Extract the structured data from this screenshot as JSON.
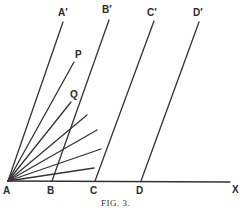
{
  "figure": {
    "caption": "Fig. 3.",
    "caption_display": "FIG. 3.",
    "stroke_color": "#333333",
    "background": "#ffffff"
  },
  "points": {
    "A": {
      "label": "A",
      "x": 8,
      "y": 181
    },
    "B": {
      "label": "B",
      "x": 52,
      "y": 181
    },
    "C": {
      "label": "C",
      "x": 95,
      "y": 181
    },
    "D": {
      "label": "D",
      "x": 141,
      "y": 181
    },
    "X": {
      "label": "X",
      "x": 230,
      "y": 182
    }
  },
  "upper_points": {
    "A_prime": {
      "label": "A′",
      "x": 63,
      "y": 22
    },
    "B_prime": {
      "label": "B′",
      "x": 109,
      "y": 20
    },
    "C_prime": {
      "label": "C′",
      "x": 154,
      "y": 21
    },
    "D_prime": {
      "label": "D′",
      "x": 199,
      "y": 22
    },
    "P": {
      "label": "P",
      "x": 74,
      "y": 62
    },
    "Q": {
      "label": "Q",
      "x": 71,
      "y": 102
    }
  },
  "labels": {
    "A": "A",
    "B": "B",
    "C": "C",
    "D": "D",
    "X": "X",
    "A_prime": "A′",
    "B_prime": "B′",
    "C_prime": "C′",
    "D_prime": "D′",
    "P": "P",
    "Q": "Q"
  },
  "fan_rays_from_A": [
    {
      "to_x": 87,
      "to_y": 115
    },
    {
      "to_x": 97,
      "to_y": 130
    },
    {
      "to_x": 101,
      "to_y": 149
    },
    {
      "to_x": 94,
      "to_y": 168
    }
  ]
}
